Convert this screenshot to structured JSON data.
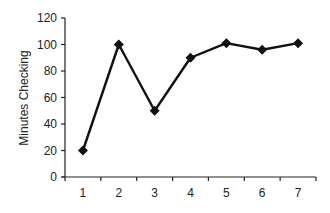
{
  "chart_data": {
    "type": "line",
    "title": "",
    "xlabel": "",
    "ylabel": "Minutes Checking",
    "categories": [
      "1",
      "2",
      "3",
      "4",
      "5",
      "6",
      "7"
    ],
    "series": [
      {
        "name": "Minutes Checking",
        "values": [
          20,
          100,
          50,
          90,
          101,
          96,
          101
        ],
        "color": "#111111",
        "marker": "diamond"
      }
    ],
    "ylim": [
      0,
      120
    ],
    "yticks": [
      0,
      20,
      40,
      60,
      80,
      100,
      120
    ],
    "grid": false,
    "legend": "none"
  }
}
